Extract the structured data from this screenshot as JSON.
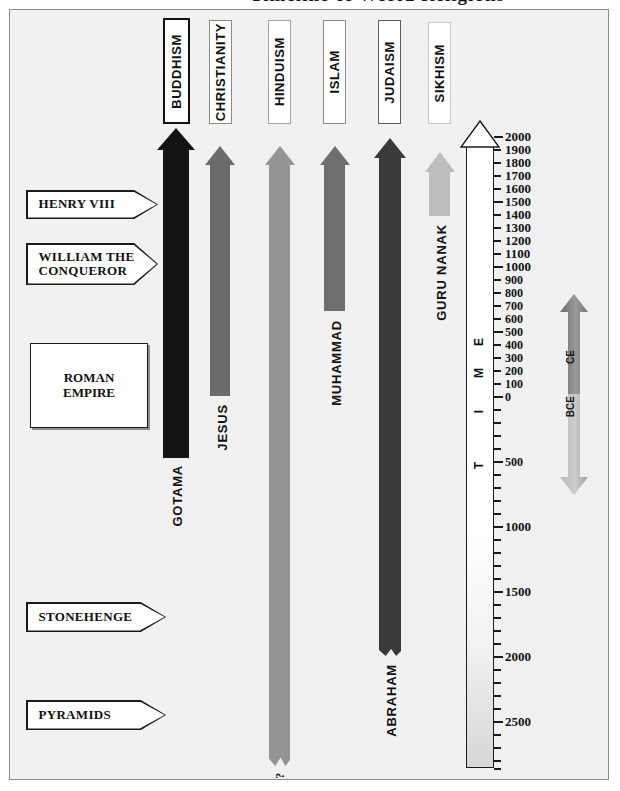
{
  "title_sliver": "Timeline of World Religions",
  "frame": {
    "background": "#f1f1f1",
    "border_color": "#8c8c8c"
  },
  "chart_data": {
    "type": "bar",
    "title": "Timeline of World Religions",
    "orientation": "vertical-timeline",
    "xlabel": "",
    "ylabel": "TIME",
    "axis": {
      "label_word": "TIME",
      "era_up": "CE",
      "era_down": "BCE",
      "top_value": 2000,
      "bottom_value": 2800,
      "ce_ticks": [
        2000,
        1900,
        1800,
        1700,
        1600,
        1500,
        1400,
        1300,
        1200,
        1100,
        1000,
        900,
        800,
        700,
        600,
        500,
        400,
        300,
        200,
        100,
        0
      ],
      "bce_labeled_ticks": [
        500,
        1000,
        1500,
        2000,
        2500
      ],
      "bce_minor_step": 100,
      "grid": false,
      "direction": "2000 CE at top, 2800 BCE at bottom"
    },
    "categories": [
      "BUDDHISM",
      "CHRISTIANITY",
      "HINDUISM",
      "ISLAM",
      "JUDAISM",
      "SIKHISM"
    ],
    "series": [
      {
        "name": "religion-origin-year",
        "values": [
          -500,
          0,
          -2500,
          600,
          -1800,
          1500
        ],
        "units": "year (negative = BCE)"
      }
    ],
    "founders": [
      "GOTAMA",
      "JESUS",
      "?",
      "MUHAMMAD",
      "ABRAHAM",
      "GURU NANAK"
    ],
    "annotations": [
      "HENRY VIII",
      "WILLIAM THE CONQUEROR",
      "ROMAN EMPIRE",
      "STONEHENGE",
      "PYRAMIDS"
    ]
  },
  "religions": [
    {
      "name": "BUDDHISM",
      "founder": "GOTAMA",
      "color": "#141414",
      "box_border": "#111111",
      "box_border_width": "2px",
      "box": {
        "left": 163,
        "top": 18,
        "width": 27,
        "height": 106
      },
      "bar": {
        "left": 163,
        "top": 143,
        "width": 26,
        "bottom": 458
      },
      "head": {
        "top": 128,
        "halfwidth": 19,
        "height": 22
      },
      "founder_label": {
        "left": 170,
        "top": 465
      }
    },
    {
      "name": "CHRISTIANITY",
      "founder": "JESUS",
      "color": "#6b6b6b",
      "box_border": "#8a8a8a",
      "box_border_width": "1px",
      "box": {
        "left": 209,
        "top": 20,
        "width": 23,
        "height": 104
      },
      "bar": {
        "left": 210,
        "top": 160,
        "width": 20,
        "bottom": 396
      },
      "head": {
        "top": 146,
        "halfwidth": 15,
        "height": 19
      },
      "founder_label": {
        "left": 215,
        "top": 404
      }
    },
    {
      "name": "HINDUISM",
      "founder": "?",
      "color": "#949494",
      "box_border": "#a5a5a5",
      "box_border_width": "1px",
      "box": {
        "left": 268,
        "top": 20,
        "width": 23,
        "height": 104
      },
      "bar": {
        "left": 269,
        "top": 160,
        "width": 21,
        "bottom": 766
      },
      "head": {
        "top": 146,
        "halfwidth": 15,
        "height": 19
      },
      "founder_label": {
        "left": 273,
        "top": 772
      }
    },
    {
      "name": "ISLAM",
      "founder": "MUHAMMAD",
      "color": "#6e6e6e",
      "box_border": "#8a8a8a",
      "box_border_width": "1px",
      "box": {
        "left": 323,
        "top": 20,
        "width": 23,
        "height": 104
      },
      "bar": {
        "left": 324,
        "top": 160,
        "width": 21,
        "bottom": 311
      },
      "head": {
        "top": 146,
        "halfwidth": 15,
        "height": 19
      },
      "founder_label": {
        "left": 329,
        "top": 320
      }
    },
    {
      "name": "JUDAISM",
      "founder": "ABRAHAM",
      "color": "#3a3a3a",
      "box_border": "#5c5c5c",
      "box_border_width": "1px",
      "box": {
        "left": 378,
        "top": 20,
        "width": 23,
        "height": 104
      },
      "bar": {
        "left": 379,
        "top": 153,
        "width": 22,
        "bottom": 656
      },
      "head": {
        "top": 138,
        "halfwidth": 16,
        "height": 20
      },
      "founder_label": {
        "left": 384,
        "top": 664
      }
    },
    {
      "name": "SIKHISM",
      "founder": "GURU NANAK",
      "color": "#bdbdbd",
      "box_border": "#c9c9c9",
      "box_border_width": "1px",
      "box": {
        "left": 428,
        "top": 22,
        "width": 23,
        "height": 102
      },
      "bar": {
        "left": 429,
        "top": 167,
        "width": 21,
        "bottom": 216
      },
      "head": {
        "top": 152,
        "halfwidth": 15,
        "height": 20
      },
      "founder_label": {
        "left": 434,
        "top": 224
      }
    }
  ],
  "events": [
    {
      "label": "HENRY VIII",
      "shape": "pentagon",
      "left": 26,
      "top": 190,
      "width": 132,
      "height": 29,
      "lines": [
        "HENRY VIII"
      ]
    },
    {
      "label": "WILLIAM THE CONQUEROR",
      "shape": "pentagon",
      "left": 26,
      "top": 243,
      "width": 132,
      "height": 42,
      "lines": [
        "WILLIAM THE",
        "CONQUEROR"
      ]
    },
    {
      "label": "ROMAN EMPIRE",
      "shape": "rect",
      "left": 30,
      "top": 343,
      "width": 118,
      "height": 85,
      "lines": [
        "ROMAN",
        "EMPIRE"
      ]
    },
    {
      "label": "STONEHENGE",
      "shape": "pentagon",
      "left": 26,
      "top": 602,
      "width": 140,
      "height": 30,
      "lines": [
        "STONEHENGE"
      ]
    },
    {
      "label": "PYRAMIDS",
      "shape": "pentagon",
      "left": 26,
      "top": 700,
      "width": 140,
      "height": 30,
      "lines": [
        "PYRAMIDS"
      ]
    }
  ],
  "axis": {
    "word": "TIME",
    "letters": [
      "T",
      "I",
      "M",
      "E"
    ],
    "bar": {
      "left": 466,
      "top": 144,
      "width": 28,
      "height": 624
    },
    "head": {
      "top": 120,
      "halfwidth": 20,
      "height": 26
    },
    "ticks_ce": [
      {
        "value": "2000",
        "y": 136,
        "major": true
      },
      {
        "value": "1900",
        "y": 149,
        "major": false
      },
      {
        "value": "1800",
        "y": 162,
        "major": false
      },
      {
        "value": "1700",
        "y": 175,
        "major": false
      },
      {
        "value": "1600",
        "y": 188,
        "major": false
      },
      {
        "value": "1500",
        "y": 201,
        "major": true
      },
      {
        "value": "1400",
        "y": 214,
        "major": false
      },
      {
        "value": "1300",
        "y": 227,
        "major": false
      },
      {
        "value": "1200",
        "y": 240,
        "major": false
      },
      {
        "value": "1100",
        "y": 253,
        "major": false
      },
      {
        "value": "1000",
        "y": 266,
        "major": true
      },
      {
        "value": "900",
        "y": 279,
        "major": false
      },
      {
        "value": "800",
        "y": 292,
        "major": false
      },
      {
        "value": "700",
        "y": 305,
        "major": false
      },
      {
        "value": "600",
        "y": 318,
        "major": false
      },
      {
        "value": "500",
        "y": 331,
        "major": true
      },
      {
        "value": "400",
        "y": 344,
        "major": false
      },
      {
        "value": "300",
        "y": 357,
        "major": false
      },
      {
        "value": "200",
        "y": 370,
        "major": false
      },
      {
        "value": "100",
        "y": 383,
        "major": false
      },
      {
        "value": "0",
        "y": 396,
        "major": true
      }
    ],
    "ticks_bce": [
      {
        "value": "",
        "y": 409
      },
      {
        "value": "",
        "y": 422
      },
      {
        "value": "",
        "y": 435
      },
      {
        "value": "",
        "y": 448
      },
      {
        "value": "500",
        "y": 461
      },
      {
        "value": "",
        "y": 474
      },
      {
        "value": "",
        "y": 487
      },
      {
        "value": "",
        "y": 500
      },
      {
        "value": "",
        "y": 513
      },
      {
        "value": "1000",
        "y": 526
      },
      {
        "value": "",
        "y": 539
      },
      {
        "value": "",
        "y": 552
      },
      {
        "value": "",
        "y": 565
      },
      {
        "value": "",
        "y": 578
      },
      {
        "value": "1500",
        "y": 591
      },
      {
        "value": "",
        "y": 604
      },
      {
        "value": "",
        "y": 617
      },
      {
        "value": "",
        "y": 630
      },
      {
        "value": "",
        "y": 643
      },
      {
        "value": "2000",
        "y": 656
      },
      {
        "value": "",
        "y": 669
      },
      {
        "value": "",
        "y": 682
      },
      {
        "value": "",
        "y": 695
      },
      {
        "value": "",
        "y": 708
      },
      {
        "value": "2500",
        "y": 721
      },
      {
        "value": "",
        "y": 734
      },
      {
        "value": "",
        "y": 747
      },
      {
        "value": "",
        "y": 760
      },
      {
        "value": "",
        "y": 768
      }
    ]
  },
  "era_arrow": {
    "up_label": "CE",
    "down_label": "BCE",
    "left": 558,
    "top": 292,
    "width": 32,
    "height": 205,
    "color_dark": "#6a6a6a",
    "color_light": "#cccccc"
  },
  "hinduism_question_mark": "?"
}
